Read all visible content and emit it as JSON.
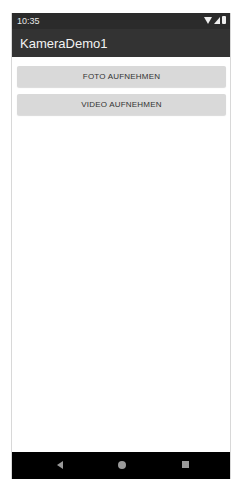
{
  "status_bar": {
    "time": "10:35",
    "icons": [
      "wifi-icon",
      "signal-icon",
      "battery-icon"
    ]
  },
  "app_bar": {
    "title": "KameraDemo1"
  },
  "buttons": {
    "photo": "FOTO AUFNEHMEN",
    "video": "VIDEO AUFNEHMEN"
  },
  "nav_bar": {
    "icons": [
      "back-icon",
      "home-icon",
      "recents-icon"
    ]
  },
  "colors": {
    "status_bar": "#2b2b2b",
    "app_bar": "#333333",
    "button": "#d9d9d9",
    "nav_bar": "#000000"
  }
}
